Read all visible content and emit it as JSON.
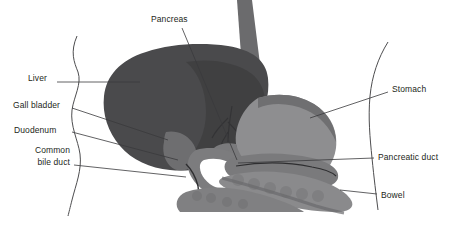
{
  "figure": {
    "background_color": "#ffffff",
    "width": 457,
    "height": 227
  },
  "palette": {
    "liver": "#4a4a4c",
    "liver_shadow": "#3c3c3e",
    "stomach": "#8e8e90",
    "stomach_dark": "#6f6f71",
    "esophagus": "#6b6b6d",
    "duodenum": "#7c7c7e",
    "pancreas": "#7a7a7c",
    "bowel": "#8a8a8c",
    "bowel_dark": "#737375",
    "duct": "#2e2e30",
    "outline": "#4d4d4f",
    "leader_line": "#3a3a3c",
    "text": "#231f20"
  },
  "labels": [
    {
      "id": "pancreas",
      "text": "Pancreas",
      "x": 151,
      "y": 14,
      "align": "left",
      "leader": {
        "x1": 182,
        "y1": 28,
        "x2": 237,
        "y2": 160
      }
    },
    {
      "id": "liver",
      "text": "Liver",
      "x": 28,
      "y": 73,
      "align": "left",
      "leader": {
        "x1": 57,
        "y1": 82,
        "x2": 140,
        "y2": 82
      }
    },
    {
      "id": "gall-bladder",
      "text": "Gall bladder",
      "x": 13,
      "y": 100,
      "align": "left",
      "leader": {
        "x1": 72,
        "y1": 108,
        "x2": 168,
        "y2": 140
      }
    },
    {
      "id": "duodenum",
      "text": "Duodenum",
      "x": 14,
      "y": 125,
      "align": "left",
      "leader": {
        "x1": 72,
        "y1": 132,
        "x2": 178,
        "y2": 160
      }
    },
    {
      "id": "common-bile-duct",
      "text": "Common bile duct",
      "line1": "Common",
      "line2": "bile duct",
      "x": 14,
      "y": 145,
      "align": "right",
      "leader": {
        "x1": 74,
        "y1": 165,
        "x2": 186,
        "y2": 177
      }
    },
    {
      "id": "stomach",
      "text": "Stomach",
      "x": 392,
      "y": 84,
      "align": "left",
      "leader": {
        "x1": 388,
        "y1": 92,
        "x2": 310,
        "y2": 118
      }
    },
    {
      "id": "pancreatic-duct",
      "text": "Pancreatic duct",
      "x": 378,
      "y": 152,
      "align": "left",
      "leader": {
        "x1": 374,
        "y1": 158,
        "x2": 238,
        "y2": 163
      }
    },
    {
      "id": "bowel",
      "text": "Bowel",
      "x": 381,
      "y": 190,
      "align": "left",
      "leader": {
        "x1": 377,
        "y1": 194,
        "x2": 340,
        "y2": 190
      }
    }
  ],
  "structures": [
    {
      "id": "body-outline-left",
      "name": "Left body wall contour"
    },
    {
      "id": "body-outline-right",
      "name": "Right body wall contour"
    },
    {
      "id": "esophagus",
      "name": "Esophagus"
    },
    {
      "id": "liver",
      "name": "Liver"
    },
    {
      "id": "stomach",
      "name": "Stomach"
    },
    {
      "id": "gall-bladder",
      "name": "Gall bladder"
    },
    {
      "id": "common-bile-duct",
      "name": "Common bile duct"
    },
    {
      "id": "duodenum",
      "name": "Duodenum"
    },
    {
      "id": "pancreas",
      "name": "Pancreas"
    },
    {
      "id": "pancreatic-duct",
      "name": "Pancreatic duct"
    },
    {
      "id": "bowel",
      "name": "Bowel"
    }
  ]
}
